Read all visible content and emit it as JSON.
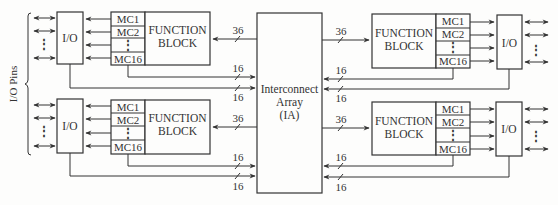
{
  "diagram": {
    "side_label": "I/O Pins",
    "interconnect": {
      "line1": "Interconnect",
      "line2": "Array",
      "line3": "(IA)"
    },
    "blocks": [
      {
        "id": "top-left",
        "io_label": "I/O",
        "fb_line1": "FUNCTION",
        "fb_line2": "BLOCK",
        "macrocells": [
          "MC1",
          "MC2",
          "⋮",
          "MC16"
        ],
        "bus_in": "36",
        "bus_out_mc": "16",
        "bus_out_io": "16"
      },
      {
        "id": "bottom-left",
        "io_label": "I/O",
        "fb_line1": "FUNCTION",
        "fb_line2": "BLOCK",
        "macrocells": [
          "MC1",
          "MC2",
          "⋮",
          "MC16"
        ],
        "bus_in": "36",
        "bus_out_mc": "16",
        "bus_out_io": "16"
      },
      {
        "id": "top-right",
        "io_label": "I/O",
        "fb_line1": "FUNCTION",
        "fb_line2": "BLOCK",
        "macrocells": [
          "MC1",
          "MC2",
          "⋮",
          "MC16"
        ],
        "bus_in": "36",
        "bus_out_mc": "16",
        "bus_out_io": "16"
      },
      {
        "id": "bottom-right",
        "io_label": "I/O",
        "fb_line1": "FUNCTION",
        "fb_line2": "BLOCK",
        "macrocells": [
          "MC1",
          "MC2",
          "⋮",
          "MC16"
        ],
        "bus_in": "36",
        "bus_out_mc": "16",
        "bus_out_io": "16"
      }
    ],
    "pin_dots": "⋮"
  }
}
